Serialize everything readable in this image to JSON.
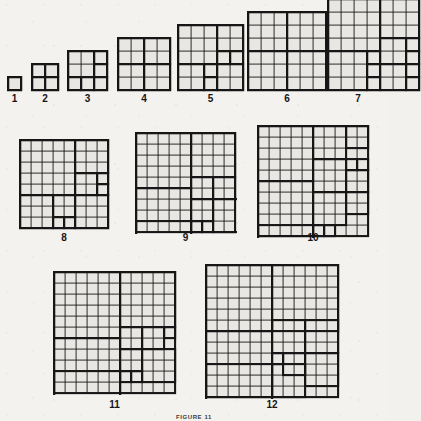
{
  "figure": {
    "caption": "FIGURE 11",
    "caption_top": 414,
    "background_color": "#f3f2ef",
    "ink_color": "#161616",
    "fill_color": "#e8e7e3",
    "thin_stroke": 0.9,
    "thick_stroke": 2.1,
    "label_font_size": 10
  },
  "chart_data": {
    "type": "diagram",
    "title": "FIGURE 11",
    "rows": [
      {
        "name": "row-1",
        "top": 12,
        "baseline": 90,
        "items": [
          "1",
          "2",
          "3",
          "4",
          "5",
          "6",
          "7"
        ]
      },
      {
        "name": "row-2",
        "top": 130,
        "baseline": 228,
        "items": [
          "8",
          "9",
          "10"
        ]
      },
      {
        "name": "row-3",
        "top": 265,
        "baseline": 395,
        "items": [
          "11",
          "12"
        ]
      }
    ],
    "squares": [
      {
        "label": "1",
        "n": 1,
        "pieces": 1,
        "x": 8,
        "y": 77,
        "size": 13,
        "unit": 13,
        "blocks": [
          [
            0,
            0,
            1
          ]
        ]
      },
      {
        "label": "2",
        "n": 2,
        "pieces": 4,
        "x": 32,
        "y": 64,
        "size": 26,
        "unit": 13,
        "blocks": [
          [
            0,
            0,
            1
          ],
          [
            1,
            0,
            1
          ],
          [
            0,
            1,
            1
          ],
          [
            1,
            1,
            1
          ]
        ]
      },
      {
        "label": "3",
        "n": 3,
        "pieces": 6,
        "x": 68,
        "y": 51,
        "size": 39,
        "unit": 13,
        "blocks": [
          [
            0,
            0,
            2
          ],
          [
            2,
            0,
            1
          ],
          [
            2,
            1,
            1
          ],
          [
            0,
            2,
            1
          ],
          [
            1,
            2,
            1
          ],
          [
            2,
            2,
            1
          ]
        ]
      },
      {
        "label": "4",
        "n": 4,
        "pieces": 4,
        "x": 118,
        "y": 38,
        "size": 52,
        "unit": 13,
        "blocks": [
          [
            0,
            0,
            2
          ],
          [
            2,
            0,
            2
          ],
          [
            0,
            2,
            2
          ],
          [
            2,
            2,
            2
          ]
        ]
      },
      {
        "label": "5",
        "n": 5,
        "pieces": 8,
        "x": 178,
        "y": 25,
        "size": 65,
        "unit": 13,
        "blocks": [
          [
            0,
            0,
            3
          ],
          [
            3,
            0,
            2
          ],
          [
            3,
            2,
            1
          ],
          [
            4,
            2,
            1
          ],
          [
            3,
            3,
            2
          ],
          [
            0,
            3,
            2
          ],
          [
            2,
            3,
            1
          ],
          [
            2,
            4,
            1
          ]
        ]
      },
      {
        "label": "6",
        "n": 6,
        "pieces": 4,
        "x": 248,
        "y": 12,
        "size": 78,
        "unit": 13,
        "blocks": [
          [
            0,
            0,
            3
          ],
          [
            3,
            0,
            3
          ],
          [
            0,
            3,
            3
          ],
          [
            3,
            3,
            3
          ]
        ]
      },
      {
        "label": "7",
        "n": 7,
        "pieces": 9,
        "x": 328,
        "y": -1,
        "size": 91,
        "unit": 13,
        "blocks": [
          [
            0,
            0,
            4
          ],
          [
            4,
            0,
            3
          ],
          [
            4,
            3,
            2
          ],
          [
            6,
            3,
            1
          ],
          [
            6,
            4,
            1
          ],
          [
            4,
            5,
            2
          ],
          [
            6,
            5,
            1
          ],
          [
            0,
            4,
            3
          ],
          [
            3,
            4,
            1
          ],
          [
            3,
            5,
            1
          ],
          [
            3,
            6,
            1
          ],
          [
            6,
            6,
            1
          ]
        ]
      },
      {
        "label": "8",
        "n": 8,
        "pieces": 9,
        "x": 20,
        "y": 140,
        "size": 88,
        "unit": 11,
        "blocks": [
          [
            0,
            0,
            5
          ],
          [
            5,
            0,
            3
          ],
          [
            5,
            3,
            2
          ],
          [
            7,
            3,
            1
          ],
          [
            7,
            4,
            1
          ],
          [
            5,
            5,
            3
          ],
          [
            0,
            5,
            3
          ],
          [
            3,
            5,
            2
          ],
          [
            3,
            7,
            1
          ],
          [
            4,
            7,
            1
          ]
        ]
      },
      {
        "label": "9",
        "n": 9,
        "pieces": 10,
        "x": 136,
        "y": 133,
        "size": 99,
        "unit": 11,
        "blocks": [
          [
            0,
            0,
            5
          ],
          [
            5,
            0,
            4
          ],
          [
            5,
            4,
            2
          ],
          [
            7,
            4,
            2
          ],
          [
            0,
            5,
            5
          ],
          [
            5,
            6,
            2
          ],
          [
            7,
            6,
            3
          ],
          [
            5,
            8,
            1
          ],
          [
            6,
            8,
            1
          ],
          [
            0,
            8,
            5
          ]
        ]
      },
      {
        "label": "10",
        "n": 10,
        "pieces": 11,
        "x": 258,
        "y": 126,
        "size": 110,
        "unit": 11,
        "blocks": [
          [
            0,
            0,
            5
          ],
          [
            5,
            0,
            3
          ],
          [
            8,
            0,
            2
          ],
          [
            5,
            3,
            3
          ],
          [
            8,
            3,
            1
          ],
          [
            9,
            3,
            1
          ],
          [
            8,
            4,
            2
          ],
          [
            0,
            5,
            5
          ],
          [
            5,
            6,
            3
          ],
          [
            8,
            6,
            2
          ],
          [
            5,
            9,
            1
          ],
          [
            6,
            9,
            1
          ],
          [
            0,
            9,
            5
          ]
        ]
      },
      {
        "label": "11",
        "n": 11,
        "pieces": 11,
        "x": 54,
        "y": 272,
        "size": 121,
        "unit": 11,
        "blocks": [
          [
            0,
            0,
            6
          ],
          [
            6,
            0,
            5
          ],
          [
            6,
            5,
            2
          ],
          [
            8,
            5,
            2
          ],
          [
            10,
            5,
            1
          ],
          [
            0,
            6,
            6
          ],
          [
            6,
            7,
            2
          ],
          [
            8,
            7,
            3
          ],
          [
            6,
            9,
            1
          ],
          [
            7,
            9,
            1
          ],
          [
            0,
            9,
            6
          ]
        ]
      },
      {
        "label": "12",
        "n": 12,
        "pieces": 11,
        "x": 206,
        "y": 265,
        "size": 132,
        "unit": 11,
        "blocks": [
          [
            0,
            0,
            6
          ],
          [
            6,
            0,
            6
          ],
          [
            6,
            5,
            3
          ],
          [
            9,
            5,
            3
          ],
          [
            0,
            6,
            6
          ],
          [
            6,
            8,
            1
          ],
          [
            7,
            8,
            2
          ],
          [
            9,
            8,
            3
          ],
          [
            6,
            9,
            3
          ],
          [
            0,
            9,
            6
          ]
        ]
      }
    ]
  },
  "labels": [
    {
      "text": "1",
      "x": 8,
      "y": 93,
      "width": 13
    },
    {
      "text": "2",
      "x": 32,
      "y": 93,
      "width": 26
    },
    {
      "text": "3",
      "x": 68,
      "y": 93,
      "width": 39
    },
    {
      "text": "4",
      "x": 118,
      "y": 93,
      "width": 52
    },
    {
      "text": "5",
      "x": 178,
      "y": 93,
      "width": 65
    },
    {
      "text": "6",
      "x": 248,
      "y": 93,
      "width": 78
    },
    {
      "text": "7",
      "x": 328,
      "y": 93,
      "width": 60
    },
    {
      "text": "8",
      "x": 20,
      "y": 232,
      "width": 88
    },
    {
      "text": "9",
      "x": 136,
      "y": 232,
      "width": 99
    },
    {
      "text": "10",
      "x": 258,
      "y": 232,
      "width": 110
    },
    {
      "text": "11",
      "x": 54,
      "y": 399,
      "width": 121
    },
    {
      "text": "12",
      "x": 206,
      "y": 399,
      "width": 132
    }
  ]
}
